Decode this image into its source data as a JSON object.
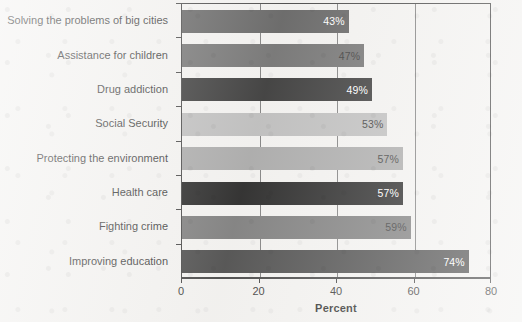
{
  "chart_data": {
    "type": "bar",
    "orientation": "horizontal",
    "title": "",
    "xlabel": "Percent",
    "ylabel": "",
    "xlim": [
      0,
      80
    ],
    "xticks": [
      0,
      20,
      40,
      60,
      80
    ],
    "xtick_labels": [
      "0",
      "20",
      "40",
      "60",
      "80"
    ],
    "grid": "vertical",
    "legend": "none",
    "categories": [
      "Solving the problems of big cities",
      "Assistance for children",
      "Drug addiction",
      "Social Security",
      "Protecting the environment",
      "Health care",
      "Fighting crime",
      "Improving education"
    ],
    "values": [
      43,
      47,
      49,
      53,
      57,
      57,
      59,
      74
    ],
    "data_labels": [
      "43%",
      "47%",
      "49%",
      "53%",
      "57%",
      "57%",
      "59%",
      "74%"
    ],
    "bar_colors": [
      "#4d4d4d",
      "#5e5e5e",
      "#1c1c1c",
      "#b5b5b5",
      "#9e9e9e",
      "#070707",
      "#6b6b6b",
      "#333333"
    ],
    "label_text_colors": [
      "#ffffff",
      "#1a1a1a",
      "#ffffff",
      "#1a1a1a",
      "#1a1a1a",
      "#ffffff",
      "#1a1a1a",
      "#ffffff"
    ]
  },
  "axis": {
    "x_title": "Percent"
  },
  "colors": {
    "page_background": "#f2f1ef",
    "frame": "#2b2b2b",
    "gridline": "#6e6e6e",
    "text": "#1a1a1a"
  }
}
